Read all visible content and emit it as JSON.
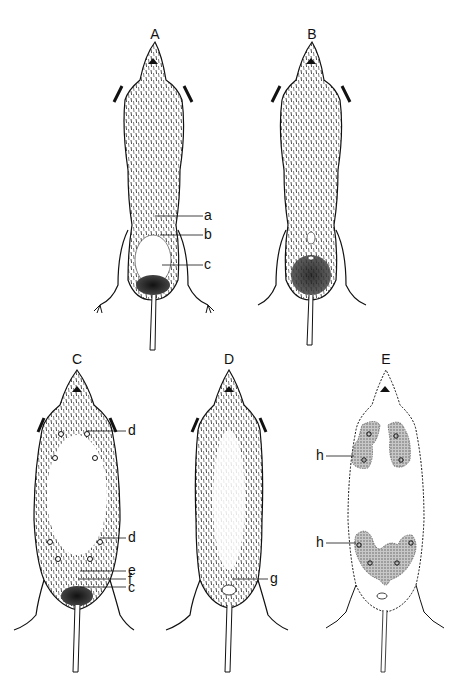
{
  "figure": {
    "panels": [
      {
        "id": "A",
        "label": "A",
        "callouts": [
          "a",
          "b",
          "c"
        ]
      },
      {
        "id": "B",
        "label": "B",
        "callouts": []
      },
      {
        "id": "C",
        "label": "C",
        "callouts": [
          "d",
          "d",
          "e",
          "f",
          "c"
        ]
      },
      {
        "id": "D",
        "label": "D",
        "callouts": [
          "g"
        ]
      },
      {
        "id": "E",
        "label": "E",
        "callouts": [
          "h",
          "h"
        ]
      }
    ]
  },
  "colors": {
    "ink": "#111111",
    "background": "#ffffff",
    "stipple": "#9a9a9a"
  }
}
